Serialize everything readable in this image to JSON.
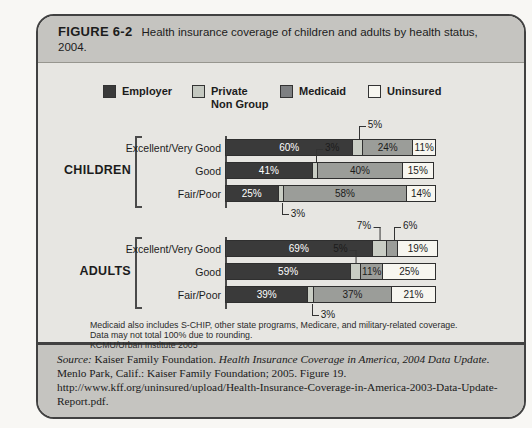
{
  "figure": {
    "label": "FIGURE 6-2",
    "title": "Health insurance coverage of children and adults by health status, 2004."
  },
  "legend": [
    {
      "key": "employer",
      "lines": [
        "Employer"
      ],
      "color": "#3a3a3a"
    },
    {
      "key": "private_non_group",
      "lines": [
        "Private",
        "Non Group"
      ],
      "color": "#c4c8c0"
    },
    {
      "key": "medicaid",
      "lines": [
        "Medicaid"
      ],
      "color": "#7e8082"
    },
    {
      "key": "uninsured",
      "lines": [
        "Uninsured"
      ],
      "color": "#f7f6f0"
    }
  ],
  "colors": {
    "page_bg": "#f8f7f4",
    "band_bg": "#c5c4c0",
    "chart_bg": "#e7e6e2",
    "box_border": "#414141",
    "label_on_dark": "#ffffff",
    "label_on_light": "#1c1c1c",
    "series": {
      "employer": "#3a3a3a",
      "private_non_group": "#c9cdc4",
      "medicaid": "#9b9d99",
      "uninsured": "#f7f6f0"
    }
  },
  "chart_data": {
    "type": "bar",
    "orientation": "horizontal",
    "stacked": true,
    "unit": "percent",
    "xlim": [
      0,
      100
    ],
    "series_names": [
      "Employer",
      "Private Non Group",
      "Medicaid",
      "Uninsured"
    ],
    "groups": [
      {
        "name": "CHILDREN",
        "rows": [
          {
            "category": "Excellent/Very Good",
            "values": [
              60,
              5,
              24,
              11
            ],
            "labels": [
              "60%",
              "5%",
              "24%",
              "11%"
            ],
            "inside_labels": [
              0,
              2,
              3
            ],
            "callouts": [
              {
                "segment": 1,
                "dir": "above",
                "text_side": "right"
              }
            ]
          },
          {
            "category": "Good",
            "values": [
              41,
              3,
              40,
              15
            ],
            "labels": [
              "41%",
              "3%",
              "40%",
              "15%"
            ],
            "inside_labels": [
              0,
              2,
              3
            ],
            "callouts": [
              {
                "segment": 1,
                "dir": "above",
                "text_side": "right"
              }
            ]
          },
          {
            "category": "Fair/Poor",
            "values": [
              25,
              3,
              58,
              14
            ],
            "labels": [
              "25%",
              "3%",
              "58%",
              "14%"
            ],
            "inside_labels": [
              0,
              2,
              3
            ],
            "callouts": [
              {
                "segment": 1,
                "dir": "below",
                "text_side": "right"
              }
            ]
          }
        ]
      },
      {
        "name": "ADULTS",
        "rows": [
          {
            "category": "Excellent/Very Good",
            "values": [
              69,
              7,
              6,
              19
            ],
            "labels": [
              "69%",
              "7%",
              "6%",
              "19%"
            ],
            "inside_labels": [
              0,
              3
            ],
            "callouts": [
              {
                "segment": 1,
                "dir": "above",
                "text_side": "left"
              },
              {
                "segment": 2,
                "dir": "above",
                "text_side": "right"
              }
            ]
          },
          {
            "category": "Good",
            "values": [
              59,
              5,
              11,
              25
            ],
            "labels": [
              "59%",
              "5%",
              "11%",
              "25%"
            ],
            "inside_labels": [
              0,
              2,
              3
            ],
            "callouts": [
              {
                "segment": 1,
                "dir": "above",
                "text_side": "left"
              }
            ]
          },
          {
            "category": "Fair/Poor",
            "values": [
              39,
              3,
              37,
              21
            ],
            "labels": [
              "39%",
              "3%",
              "37%",
              "21%"
            ],
            "inside_labels": [
              0,
              2,
              3
            ],
            "callouts": [
              {
                "segment": 1,
                "dir": "below",
                "text_side": "right"
              }
            ]
          }
        ]
      }
    ]
  },
  "footnotes": [
    "Medicaid also includes S-CHIP, other state programs, Medicare, and military-related coverage.",
    "Data may not total 100% due to rounding.",
    "KCMU/Urban Institute 2005"
  ],
  "source": {
    "label": "Source:",
    "part1": " Kaiser Family Foundation. ",
    "title": "Health Insurance Coverage in America, 2004 Data Update",
    "part2": ". Menlo Park, Calif.: Kaiser Family Foundation; 2005. Figure 19. http://www.kff.org/uninsured/upload/Health-Insurance-Coverage-in-America-2003-Data-Update-Report.pdf."
  }
}
